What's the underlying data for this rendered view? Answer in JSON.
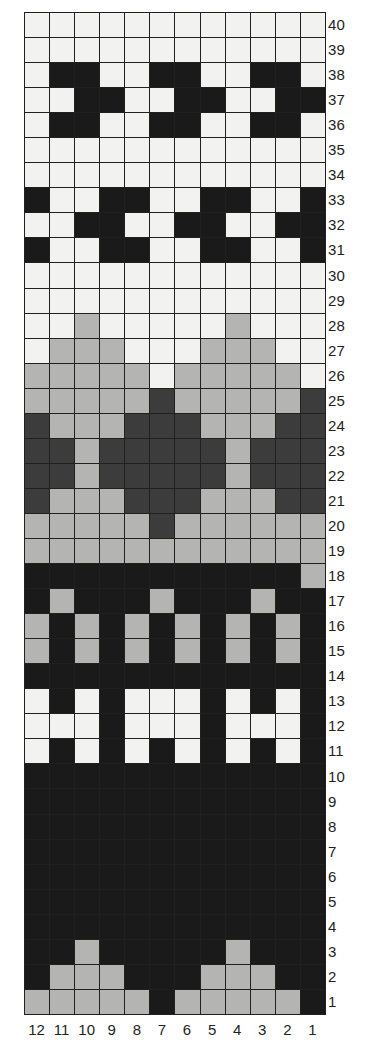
{
  "chart_data": {
    "type": "heatmap",
    "title": "",
    "xlabel": "",
    "ylabel": "",
    "grid": true,
    "legend_position": "none",
    "columns": 12,
    "rows": 40,
    "column_labels": [
      "12",
      "11",
      "10",
      "9",
      "8",
      "7",
      "6",
      "5",
      "4",
      "3",
      "2",
      "1"
    ],
    "row_labels": [
      "40",
      "39",
      "38",
      "37",
      "36",
      "35",
      "34",
      "33",
      "32",
      "31",
      "30",
      "29",
      "28",
      "27",
      "26",
      "25",
      "24",
      "23",
      "22",
      "21",
      "20",
      "19",
      "18",
      "17",
      "16",
      "15",
      "14",
      "13",
      "12",
      "11",
      "10",
      "9",
      "8",
      "7",
      "6",
      "5",
      "4",
      "3",
      "2",
      "1"
    ],
    "color_key": {
      "white": "#f2f2f0",
      "light": "#b4b4b2",
      "mid": "#3c3c3c",
      "dark": "#1a1a1a"
    },
    "value_legend": [
      {
        "code": "W",
        "name": "white",
        "hex": "#f2f2f0"
      },
      {
        "code": "L",
        "name": "light-grey",
        "hex": "#b4b4b2"
      },
      {
        "code": "M",
        "name": "mid-grey",
        "hex": "#3c3c3c"
      },
      {
        "code": "D",
        "name": "dark",
        "hex": "#1a1a1a"
      }
    ],
    "cells": [
      {
        "row": 40,
        "values": [
          "W",
          "W",
          "W",
          "W",
          "W",
          "W",
          "W",
          "W",
          "W",
          "W",
          "W",
          "W"
        ]
      },
      {
        "row": 39,
        "values": [
          "W",
          "W",
          "W",
          "W",
          "W",
          "W",
          "W",
          "W",
          "W",
          "W",
          "W",
          "W"
        ]
      },
      {
        "row": 38,
        "values": [
          "W",
          "D",
          "D",
          "W",
          "W",
          "D",
          "D",
          "W",
          "W",
          "D",
          "D",
          "W"
        ]
      },
      {
        "row": 37,
        "values": [
          "W",
          "W",
          "D",
          "D",
          "W",
          "W",
          "D",
          "D",
          "W",
          "W",
          "D",
          "D"
        ]
      },
      {
        "row": 36,
        "values": [
          "W",
          "D",
          "D",
          "W",
          "W",
          "D",
          "D",
          "W",
          "W",
          "D",
          "D",
          "W"
        ]
      },
      {
        "row": 35,
        "values": [
          "W",
          "W",
          "W",
          "W",
          "W",
          "W",
          "W",
          "W",
          "W",
          "W",
          "W",
          "W"
        ]
      },
      {
        "row": 34,
        "values": [
          "W",
          "W",
          "W",
          "W",
          "W",
          "W",
          "W",
          "W",
          "W",
          "W",
          "W",
          "W"
        ]
      },
      {
        "row": 33,
        "values": [
          "D",
          "W",
          "W",
          "D",
          "D",
          "W",
          "W",
          "D",
          "D",
          "W",
          "W",
          "D"
        ]
      },
      {
        "row": 32,
        "values": [
          "W",
          "W",
          "D",
          "D",
          "W",
          "W",
          "D",
          "D",
          "W",
          "W",
          "D",
          "D"
        ]
      },
      {
        "row": 31,
        "values": [
          "D",
          "W",
          "W",
          "D",
          "D",
          "W",
          "W",
          "D",
          "D",
          "W",
          "W",
          "D"
        ]
      },
      {
        "row": 30,
        "values": [
          "W",
          "W",
          "W",
          "W",
          "W",
          "W",
          "W",
          "W",
          "W",
          "W",
          "W",
          "W"
        ]
      },
      {
        "row": 29,
        "values": [
          "W",
          "W",
          "W",
          "W",
          "W",
          "W",
          "W",
          "W",
          "W",
          "W",
          "W",
          "W"
        ]
      },
      {
        "row": 28,
        "values": [
          "W",
          "W",
          "L",
          "W",
          "W",
          "W",
          "W",
          "W",
          "L",
          "W",
          "W",
          "W"
        ]
      },
      {
        "row": 27,
        "values": [
          "W",
          "L",
          "L",
          "L",
          "W",
          "W",
          "W",
          "L",
          "L",
          "L",
          "W",
          "W"
        ]
      },
      {
        "row": 26,
        "values": [
          "L",
          "L",
          "L",
          "L",
          "L",
          "W",
          "L",
          "L",
          "L",
          "L",
          "L",
          "W"
        ]
      },
      {
        "row": 25,
        "values": [
          "L",
          "L",
          "L",
          "L",
          "L",
          "M",
          "L",
          "L",
          "L",
          "L",
          "L",
          "M"
        ]
      },
      {
        "row": 24,
        "values": [
          "M",
          "L",
          "L",
          "L",
          "M",
          "M",
          "M",
          "L",
          "L",
          "L",
          "M",
          "M"
        ]
      },
      {
        "row": 23,
        "values": [
          "M",
          "M",
          "L",
          "M",
          "M",
          "M",
          "M",
          "M",
          "L",
          "M",
          "M",
          "M"
        ]
      },
      {
        "row": 22,
        "values": [
          "M",
          "M",
          "L",
          "M",
          "M",
          "M",
          "M",
          "M",
          "L",
          "M",
          "M",
          "M"
        ]
      },
      {
        "row": 21,
        "values": [
          "M",
          "L",
          "L",
          "L",
          "M",
          "M",
          "M",
          "L",
          "L",
          "L",
          "M",
          "M"
        ]
      },
      {
        "row": 20,
        "values": [
          "L",
          "L",
          "L",
          "L",
          "L",
          "M",
          "L",
          "L",
          "L",
          "L",
          "L",
          "L"
        ]
      },
      {
        "row": 19,
        "values": [
          "L",
          "L",
          "L",
          "L",
          "L",
          "L",
          "L",
          "L",
          "L",
          "L",
          "L",
          "L"
        ]
      },
      {
        "row": 18,
        "values": [
          "D",
          "D",
          "D",
          "D",
          "D",
          "D",
          "D",
          "D",
          "D",
          "D",
          "D",
          "L"
        ]
      },
      {
        "row": 17,
        "values": [
          "D",
          "L",
          "D",
          "D",
          "D",
          "L",
          "D",
          "D",
          "D",
          "L",
          "D",
          "D"
        ]
      },
      {
        "row": 16,
        "values": [
          "L",
          "D",
          "L",
          "D",
          "L",
          "D",
          "L",
          "D",
          "L",
          "D",
          "L",
          "D"
        ]
      },
      {
        "row": 15,
        "values": [
          "L",
          "D",
          "L",
          "D",
          "L",
          "D",
          "L",
          "D",
          "L",
          "D",
          "L",
          "D"
        ]
      },
      {
        "row": 14,
        "values": [
          "D",
          "D",
          "D",
          "D",
          "D",
          "D",
          "D",
          "D",
          "D",
          "D",
          "D",
          "D"
        ]
      },
      {
        "row": 13,
        "values": [
          "W",
          "D",
          "W",
          "D",
          "W",
          "W",
          "W",
          "D",
          "W",
          "D",
          "W",
          "D"
        ]
      },
      {
        "row": 12,
        "values": [
          "W",
          "W",
          "W",
          "D",
          "W",
          "W",
          "W",
          "D",
          "W",
          "W",
          "W",
          "D"
        ]
      },
      {
        "row": 11,
        "values": [
          "W",
          "D",
          "W",
          "D",
          "W",
          "D",
          "W",
          "D",
          "W",
          "D",
          "W",
          "D"
        ]
      },
      {
        "row": 10,
        "values": [
          "D",
          "D",
          "D",
          "D",
          "D",
          "D",
          "D",
          "D",
          "D",
          "D",
          "D",
          "D"
        ]
      },
      {
        "row": 9,
        "values": [
          "D",
          "D",
          "D",
          "D",
          "D",
          "D",
          "D",
          "D",
          "D",
          "D",
          "D",
          "D"
        ]
      },
      {
        "row": 8,
        "values": [
          "D",
          "D",
          "D",
          "D",
          "D",
          "D",
          "D",
          "D",
          "D",
          "D",
          "D",
          "D"
        ]
      },
      {
        "row": 7,
        "values": [
          "D",
          "D",
          "D",
          "D",
          "D",
          "D",
          "D",
          "D",
          "D",
          "D",
          "D",
          "D"
        ]
      },
      {
        "row": 6,
        "values": [
          "D",
          "D",
          "D",
          "D",
          "D",
          "D",
          "D",
          "D",
          "D",
          "D",
          "D",
          "D"
        ]
      },
      {
        "row": 5,
        "values": [
          "D",
          "D",
          "D",
          "D",
          "D",
          "D",
          "D",
          "D",
          "D",
          "D",
          "D",
          "D"
        ]
      },
      {
        "row": 4,
        "values": [
          "D",
          "D",
          "D",
          "D",
          "D",
          "D",
          "D",
          "D",
          "D",
          "D",
          "D",
          "D"
        ]
      },
      {
        "row": 3,
        "values": [
          "D",
          "D",
          "L",
          "D",
          "D",
          "D",
          "D",
          "D",
          "L",
          "D",
          "D",
          "D"
        ]
      },
      {
        "row": 2,
        "values": [
          "D",
          "L",
          "L",
          "L",
          "D",
          "D",
          "D",
          "L",
          "L",
          "L",
          "D",
          "D"
        ]
      },
      {
        "row": 1,
        "values": [
          "L",
          "L",
          "L",
          "L",
          "L",
          "D",
          "L",
          "L",
          "L",
          "L",
          "L",
          "D"
        ]
      }
    ]
  }
}
